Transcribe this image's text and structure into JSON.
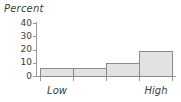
{
  "chart_data": {
    "type": "bar",
    "title": "",
    "subtitle": "",
    "xlabel": "",
    "ylabel": "Percent",
    "categories": [
      "Low",
      "",
      "",
      "High"
    ],
    "tick_labels": [
      "Low",
      "High"
    ],
    "values": [
      6,
      6,
      10,
      19
    ],
    "ylim": [
      0,
      40
    ],
    "yticks": [
      0,
      10,
      20,
      30,
      40
    ],
    "ytick_labels": [
      "0",
      "10",
      "20",
      "30",
      "40"
    ],
    "grid": false,
    "legend": null,
    "annotations": [],
    "colors": {
      "bar_fill": "#e2e2e2",
      "bar_border": "#8a8a8a",
      "axis": "#9a9a9a",
      "text": "#3d3d3d",
      "background": "#ffffff"
    }
  }
}
